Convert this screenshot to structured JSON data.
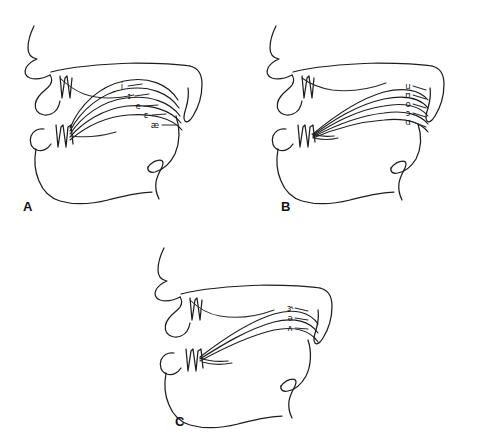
{
  "figure": {
    "type": "line-drawing",
    "background_color": "#ffffff",
    "line_color": "#1d1d1f",
    "panel_count": 3
  },
  "panels": [
    {
      "letter": "A",
      "group": "front vowels",
      "letter_x": 23,
      "letter_y": 200,
      "origin_x": 8,
      "origin_y": 6,
      "label_orientation": "stepped down and to the right",
      "vowels": [
        {
          "symbol": "i",
          "x": 114,
          "y": 80
        },
        {
          "symbol": "ɪ",
          "x": 121,
          "y": 90
        },
        {
          "symbol": "e",
          "x": 130,
          "y": 100
        },
        {
          "symbol": "ɛ",
          "x": 138,
          "y": 109
        },
        {
          "symbol": "æ",
          "x": 147,
          "y": 119
        }
      ]
    },
    {
      "letter": "B",
      "group": "back vowels",
      "letter_x": 281,
      "letter_y": 200,
      "origin_x": 250,
      "origin_y": 6,
      "label_orientation": "stacked vertically",
      "vowels": [
        {
          "symbol": "u",
          "x": 158,
          "y": 80
        },
        {
          "symbol": "ʊ",
          "x": 158,
          "y": 89
        },
        {
          "symbol": "o",
          "x": 158,
          "y": 98
        },
        {
          "symbol": "ɔ",
          "x": 158,
          "y": 107
        },
        {
          "symbol": "ɑ",
          "x": 158,
          "y": 116
        }
      ]
    },
    {
      "letter": "C",
      "group": "central vowels",
      "letter_x": 175,
      "letter_y": 415,
      "origin_x": 138,
      "origin_y": 228,
      "label_orientation": "stacked vertically",
      "vowels": [
        {
          "symbol": "ɝ",
          "x": 152,
          "y": 80
        },
        {
          "symbol": "ə",
          "x": 152,
          "y": 90
        },
        {
          "symbol": "ʌ",
          "x": 152,
          "y": 100
        }
      ]
    }
  ]
}
